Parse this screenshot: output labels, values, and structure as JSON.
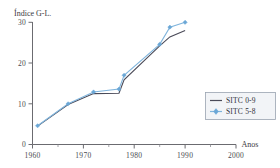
{
  "chart_data": {
    "type": "line",
    "title": "",
    "ylabel": "Índice G-L.",
    "xlabel": "Anos",
    "xlim": [
      1960,
      2000
    ],
    "ylim": [
      0,
      30
    ],
    "grid": false,
    "legend_position": "right",
    "x_ticks": [
      "1960",
      "1970",
      "1980",
      "1990",
      "2000"
    ],
    "x_tick_values": [
      1960,
      1970,
      1980,
      1990,
      2000
    ],
    "x_minor_ticks": [
      1965,
      1975,
      1985,
      1995
    ],
    "y_ticks": [
      "0",
      "10",
      "20",
      "30"
    ],
    "y_tick_values": [
      0,
      10,
      20,
      30
    ],
    "series": [
      {
        "name": "SITC 0-9",
        "color": "#4a4a58",
        "marker": "none",
        "x": [
          1961,
          1967,
          1972,
          1977,
          1978,
          1985,
          1987,
          1990
        ],
        "values": [
          4.5,
          9.8,
          12.5,
          12.6,
          15.9,
          24.2,
          26.4,
          28.0
        ]
      },
      {
        "name": "SITC 5-8",
        "color": "#7fb4dc",
        "marker": "diamond",
        "x": [
          1961,
          1967,
          1972,
          1977,
          1978,
          1985,
          1987,
          1990
        ],
        "values": [
          4.6,
          10.0,
          12.9,
          13.6,
          17.0,
          24.6,
          28.8,
          30.0
        ]
      }
    ]
  },
  "legend": {
    "items": [
      {
        "label": "SITC 0-9"
      },
      {
        "label": "SITC 5-8"
      }
    ]
  },
  "axes": {
    "y_label": "Índice G-L.",
    "x_label": "Anos",
    "y_tick_0": "0",
    "y_tick_1": "10",
    "y_tick_2": "20",
    "y_tick_3": "30",
    "x_tick_0": "1960",
    "x_tick_1": "1970",
    "x_tick_2": "1980",
    "x_tick_3": "1990",
    "x_tick_4": "2000"
  },
  "colors": {
    "series_a": "#4a4a58",
    "series_b": "#7fb4dc",
    "axis": "#6b6b70",
    "legend_bg": "#f2f4f7",
    "legend_border": "#9aa4b0"
  }
}
